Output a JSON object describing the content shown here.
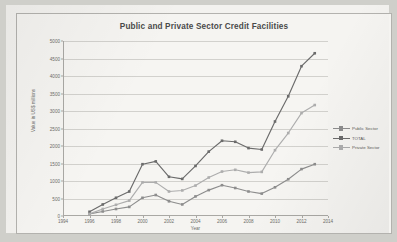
{
  "chart_data": {
    "type": "line",
    "title": "Public and Private Sector Credit Facilities",
    "xlabel": "Year",
    "ylabel": "Value in US$ millions",
    "xlim": [
      1994,
      2014
    ],
    "ylim": [
      0,
      5000
    ],
    "grid": true,
    "legend_position": "right",
    "x_ticks": [
      "1994",
      "1996",
      "1998",
      "2000",
      "2002",
      "2004",
      "2006",
      "2008",
      "2010",
      "2012",
      "2014"
    ],
    "y_ticks": [
      "0",
      "500",
      "1000",
      "1500",
      "2000",
      "2500",
      "3000",
      "3500",
      "4000",
      "4500",
      "5000"
    ],
    "x": [
      1996,
      1997,
      1998,
      1999,
      2000,
      2001,
      2002,
      2003,
      2004,
      2005,
      2006,
      2007,
      2008,
      2009,
      2010,
      2011,
      2012,
      2013
    ],
    "series": [
      {
        "name": "Public Sector",
        "color": "#8d8d8d",
        "marker": "square",
        "values": [
          60,
          130,
          200,
          260,
          520,
          600,
          420,
          330,
          560,
          740,
          880,
          800,
          700,
          640,
          820,
          1050,
          1340,
          1480
        ]
      },
      {
        "name": "TOTAL",
        "color": "#6b6b6b",
        "marker": "square",
        "values": [
          120,
          330,
          520,
          700,
          1480,
          1560,
          1120,
          1060,
          1430,
          1840,
          2150,
          2120,
          1940,
          1900,
          2700,
          3420,
          4280,
          4650
        ]
      },
      {
        "name": "Private Sector",
        "color": "#adadad",
        "marker": "square",
        "values": [
          60,
          200,
          320,
          440,
          960,
          960,
          700,
          730,
          870,
          1100,
          1270,
          1320,
          1240,
          1260,
          1880,
          2370,
          2940,
          3170
        ]
      }
    ]
  },
  "legend": {
    "items": [
      {
        "label": "Public Sector"
      },
      {
        "label": "TOTAL"
      },
      {
        "label": "Private Sector"
      }
    ]
  }
}
